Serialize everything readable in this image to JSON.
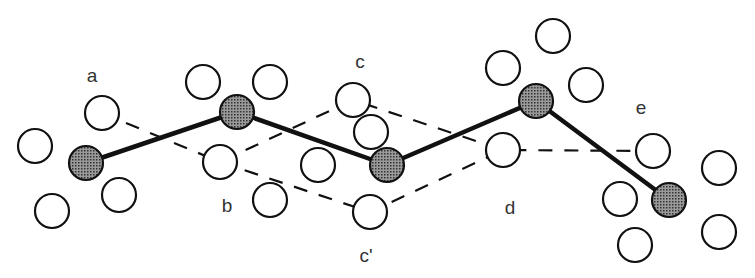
{
  "diagram": {
    "colors": {
      "stroke": "#111111",
      "shaded_fill": "#555555",
      "open_fill": "#ffffff",
      "label": "#333333"
    },
    "labels": [
      {
        "id": "a",
        "text": "a",
        "x": 92,
        "y": 82
      },
      {
        "id": "b",
        "text": "b",
        "x": 227,
        "y": 212
      },
      {
        "id": "c",
        "text": "c",
        "x": 360,
        "y": 68
      },
      {
        "id": "c-prime",
        "text": "c'",
        "x": 366,
        "y": 262
      },
      {
        "id": "d",
        "text": "d",
        "x": 510,
        "y": 214
      },
      {
        "id": "e",
        "text": "e",
        "x": 641,
        "y": 114
      }
    ],
    "shaded_atoms": [
      {
        "x": 86,
        "y": 163
      },
      {
        "x": 237,
        "y": 112
      },
      {
        "x": 387,
        "y": 165
      },
      {
        "x": 536,
        "y": 101
      },
      {
        "x": 669,
        "y": 200
      }
    ],
    "open_atoms": [
      {
        "x": 35,
        "y": 146
      },
      {
        "x": 102,
        "y": 113
      },
      {
        "x": 52,
        "y": 211
      },
      {
        "x": 119,
        "y": 195
      },
      {
        "x": 203,
        "y": 82
      },
      {
        "x": 270,
        "y": 82
      },
      {
        "x": 220,
        "y": 162
      },
      {
        "x": 270,
        "y": 200
      },
      {
        "x": 353,
        "y": 100
      },
      {
        "x": 371,
        "y": 132
      },
      {
        "x": 318,
        "y": 165
      },
      {
        "x": 370,
        "y": 212
      },
      {
        "x": 503,
        "y": 68
      },
      {
        "x": 553,
        "y": 36
      },
      {
        "x": 586,
        "y": 85
      },
      {
        "x": 503,
        "y": 150
      },
      {
        "x": 653,
        "y": 151
      },
      {
        "x": 719,
        "y": 168
      },
      {
        "x": 620,
        "y": 199
      },
      {
        "x": 719,
        "y": 232
      },
      {
        "x": 635,
        "y": 245
      }
    ],
    "solid_chain": [
      [
        86,
        163
      ],
      [
        237,
        112
      ],
      [
        387,
        165
      ],
      [
        536,
        101
      ],
      [
        669,
        200
      ]
    ],
    "dashed_paths": [
      [
        [
          102,
          113
        ],
        [
          220,
          162
        ],
        [
          353,
          100
        ],
        [
          503,
          150
        ],
        [
          653,
          151
        ]
      ],
      [
        [
          220,
          162
        ],
        [
          370,
          212
        ],
        [
          503,
          150
        ]
      ]
    ]
  }
}
